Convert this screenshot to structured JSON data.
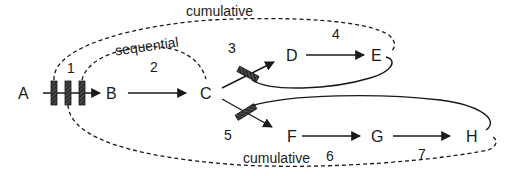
{
  "diagram": {
    "nodes": [
      {
        "id": "A",
        "label": "A",
        "x": 24,
        "y": 99
      },
      {
        "id": "B",
        "label": "B",
        "x": 112,
        "y": 99
      },
      {
        "id": "C",
        "label": "C",
        "x": 206,
        "y": 99
      },
      {
        "id": "D",
        "label": "D",
        "x": 292,
        "y": 61
      },
      {
        "id": "E",
        "label": "E",
        "x": 377,
        "y": 61
      },
      {
        "id": "F",
        "label": "F",
        "x": 293,
        "y": 142
      },
      {
        "id": "G",
        "label": "G",
        "x": 377,
        "y": 142
      },
      {
        "id": "H",
        "label": "H",
        "x": 472,
        "y": 142
      }
    ],
    "step_numbers": [
      {
        "label": "1",
        "x": 71,
        "y": 73
      },
      {
        "label": "2",
        "x": 154,
        "y": 72
      },
      {
        "label": "3",
        "x": 232,
        "y": 53
      },
      {
        "label": "4",
        "x": 336,
        "y": 39
      },
      {
        "label": "5",
        "x": 228,
        "y": 140
      },
      {
        "label": "6",
        "x": 330,
        "y": 161
      },
      {
        "label": "7",
        "x": 422,
        "y": 159
      }
    ],
    "labels": {
      "sequential": "sequential",
      "cumulative_top": "cumulative",
      "cumulative_bottom": "cumulative"
    },
    "colors": {
      "stroke": "#1a1a1a",
      "bar_fill": "#2a2a2a",
      "bar_hatch": "#8a8a8a",
      "background": "#ffffff"
    }
  }
}
